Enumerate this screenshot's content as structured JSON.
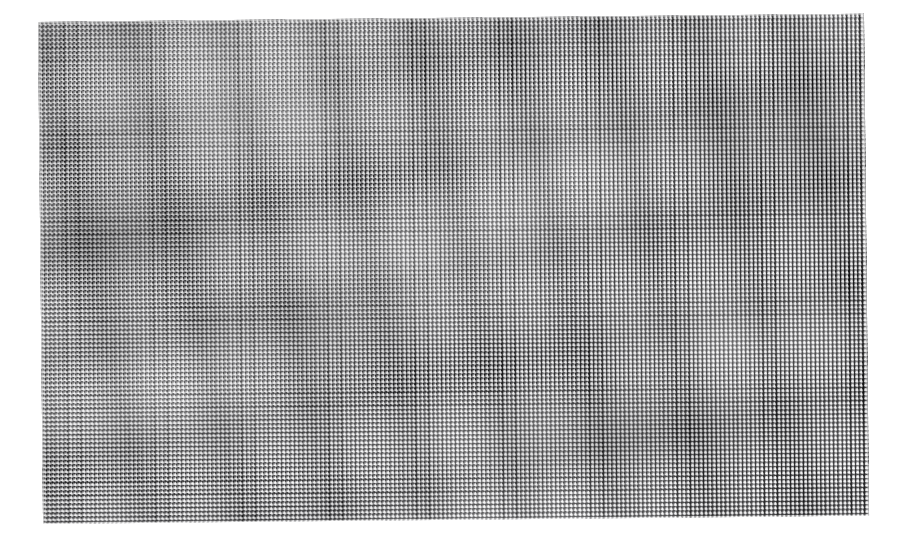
{
  "image": {
    "subject": "woven wire mesh screen",
    "background_color": "#ffffff",
    "thread_color": "#0a0a0c",
    "aperture_color": "#ffffff",
    "midtone_color": "#96969b",
    "width": 898,
    "height": 553
  },
  "mesh": {
    "pattern": "plain-weave square grid",
    "cell_period_px": 4.35,
    "thread_width_px": 2.4,
    "aperture_width_px": 1.95,
    "rotation_deg": -0.58,
    "sheet": {
      "left": 38,
      "top": 22,
      "width": 826,
      "height": 502
    },
    "corners": {
      "top_left": "38,33",
      "top_right": "862,25",
      "bottom_right": "866,518",
      "bottom_left": "42,531"
    },
    "columns": 190,
    "rows": 115,
    "moire": "visible interference banding"
  }
}
